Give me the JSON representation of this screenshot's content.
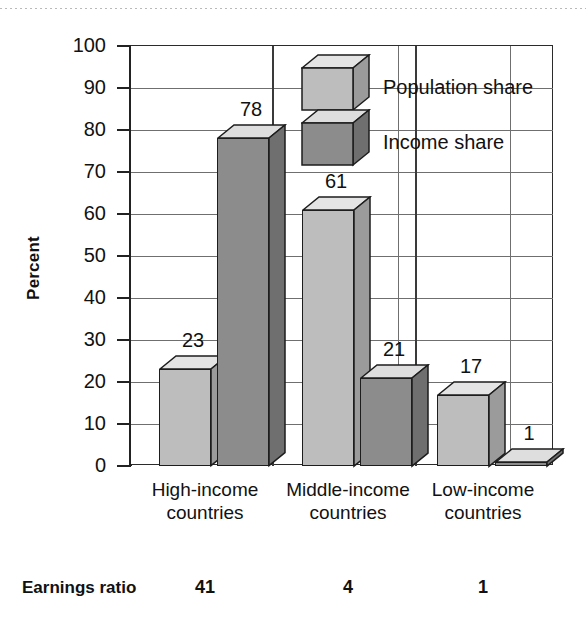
{
  "chart_data": {
    "type": "bar",
    "title": "",
    "subtitle": "",
    "xlabel": "",
    "ylabel": "Percent",
    "ylim": [
      0,
      100
    ],
    "ytick_labels": [
      "100",
      "90",
      "80",
      "70",
      "60",
      "50",
      "40",
      "30",
      "20",
      "10",
      "0"
    ],
    "ytick_values": [
      100,
      90,
      80,
      70,
      60,
      50,
      40,
      30,
      20,
      10,
      0
    ],
    "grid": true,
    "legend_position": "inside-top-center",
    "categories": [
      "High-income countries",
      "Middle-income countries",
      "Low-income countries"
    ],
    "category_lines": [
      [
        "High-income",
        "countries"
      ],
      [
        "Middle-income",
        "countries"
      ],
      [
        "Low-income",
        "countries"
      ]
    ],
    "series": [
      {
        "name": "Population share",
        "values": [
          23,
          61,
          17
        ],
        "color": "#bdbdbd",
        "top_color": "#e4e4e4",
        "side_color": "#9b9b9b"
      },
      {
        "name": "Income share",
        "values": [
          78,
          21,
          1
        ],
        "color": "#8c8c8c",
        "top_color": "#dedede",
        "side_color": "#6f6f6f"
      }
    ],
    "value_labels": [
      [
        "23",
        "78"
      ],
      [
        "61",
        "21"
      ],
      [
        "17",
        "1"
      ]
    ],
    "footer_row": {
      "label": "Earnings ratio",
      "values": [
        "41",
        "4",
        "1"
      ]
    },
    "colors": {
      "axis": "#222222",
      "grid": "#6f6f6f",
      "text": "#111111",
      "background": "#ffffff",
      "population_share": "#bdbdbd",
      "income_share": "#8c8c8c"
    }
  }
}
